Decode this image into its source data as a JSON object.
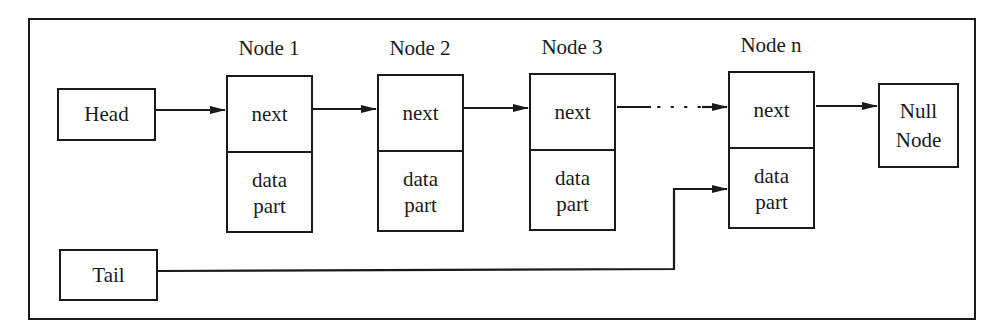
{
  "diagram": {
    "type": "singly-linked-list",
    "head": {
      "label": "Head"
    },
    "tail": {
      "label": "Tail"
    },
    "nodes": [
      {
        "title": "Node 1",
        "next_label": "next",
        "data_label": "data\npart"
      },
      {
        "title": "Node 2",
        "next_label": "next",
        "data_label": "data\npart"
      },
      {
        "title": "Node 3",
        "next_label": "next",
        "data_label": "data\npart"
      },
      {
        "title": "Node n",
        "next_label": "next",
        "data_label": "data\npart"
      }
    ],
    "null_node": {
      "label": "Null\nNode"
    },
    "edges": [
      {
        "from": "Head",
        "to": "Node 1.next",
        "style": "solid"
      },
      {
        "from": "Node 1.next",
        "to": "Node 2.next",
        "style": "solid"
      },
      {
        "from": "Node 2.next",
        "to": "Node 3.next",
        "style": "solid"
      },
      {
        "from": "Node 3.next",
        "to": "Node n.next",
        "style": "dotted"
      },
      {
        "from": "Node n.next",
        "to": "Null Node",
        "style": "solid"
      },
      {
        "from": "Tail",
        "to": "Node n.data part",
        "style": "solid-elbow"
      }
    ],
    "colors": {
      "stroke": "#1a1a1a",
      "background": "#ffffff"
    }
  }
}
